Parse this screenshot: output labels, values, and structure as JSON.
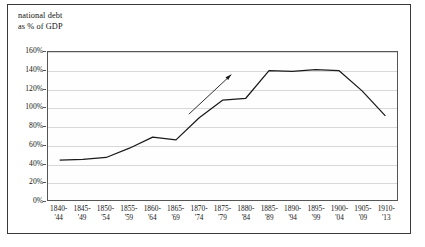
{
  "figure": {
    "title_line1": "national debt",
    "title_line2": "as % of GDP",
    "frame_color": "#3a3a3a",
    "line_color": "#1a1a1a",
    "grid_color": "#d8d8d8"
  },
  "annotation": {
    "name": "trend-arrow",
    "description": "upward arrow along the steeply rising segment"
  },
  "chart_data": {
    "type": "line",
    "title": "national debt as % of GDP",
    "xlabel": "",
    "ylabel": "as % of GDP",
    "grid": true,
    "legend": false,
    "ylim": [
      0,
      160
    ],
    "yticks": [
      0,
      20,
      40,
      60,
      80,
      100,
      120,
      140,
      160
    ],
    "ytick_labels": [
      "0%",
      "20%",
      "40%",
      "60%",
      "80%",
      "100%",
      "120%",
      "140%",
      "160%"
    ],
    "categories": [
      "1840-'44",
      "1845-'49",
      "1850-'54",
      "1855-'59",
      "1860-'64",
      "1865-'69",
      "1870-'74",
      "1875-'79",
      "1880-'84",
      "1885-'89",
      "1890-'94",
      "1895-'99",
      "1900-'04",
      "1905-'09",
      "1910-'13"
    ],
    "xtick_labels": [
      {
        "line1": "1840-",
        "line2": "'44"
      },
      {
        "line1": "1845-",
        "line2": "'49"
      },
      {
        "line1": "1850-",
        "line2": "'54"
      },
      {
        "line1": "1855-",
        "line2": "'59"
      },
      {
        "line1": "1860-",
        "line2": "'64"
      },
      {
        "line1": "1865-",
        "line2": "'69"
      },
      {
        "line1": "1870-",
        "line2": "'74"
      },
      {
        "line1": "1875-",
        "line2": "'79"
      },
      {
        "line1": "1880-",
        "line2": "'84"
      },
      {
        "line1": "1885-",
        "line2": "'89"
      },
      {
        "line1": "1890-",
        "line2": "'94"
      },
      {
        "line1": "1895-",
        "line2": "'99"
      },
      {
        "line1": "1900-",
        "line2": "'04"
      },
      {
        "line1": "1905-",
        "line2": "'09"
      },
      {
        "line1": "1910-",
        "line2": "'13"
      }
    ],
    "series": [
      {
        "name": "national debt as % of GDP",
        "values": [
          43,
          44,
          46,
          56,
          68,
          65,
          89,
          108,
          110,
          140,
          139,
          141,
          140,
          118,
          91
        ]
      }
    ]
  }
}
